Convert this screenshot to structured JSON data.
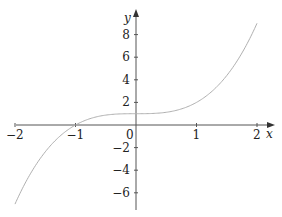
{
  "chart_data": {
    "type": "line",
    "title": "",
    "xlabel": "x",
    "ylabel": "y",
    "function": "y = x^3 + 1",
    "xlim": [
      -2,
      2
    ],
    "ylim": [
      -7,
      9
    ],
    "grid": false,
    "x_ticks": [
      -2,
      -1,
      0,
      1,
      2
    ],
    "x_tick_labels": [
      "−2",
      "−1",
      "0",
      "1",
      "2"
    ],
    "y_ticks": [
      8,
      6,
      4,
      2,
      -2,
      -4,
      -6
    ],
    "y_tick_labels": [
      "8",
      "6",
      "4",
      "2",
      "−2",
      "−4",
      "−6"
    ],
    "series": [
      {
        "name": "curve",
        "x": [
          -2,
          -1.5,
          -1,
          -0.5,
          0,
          0.5,
          1,
          1.5,
          2
        ],
        "y": [
          -7,
          -2.375,
          0,
          0.875,
          1,
          1.125,
          2,
          4.375,
          9
        ]
      }
    ],
    "colors": {
      "axis": "#555555",
      "curve": "#b0b0b0",
      "text": "#222222"
    }
  }
}
